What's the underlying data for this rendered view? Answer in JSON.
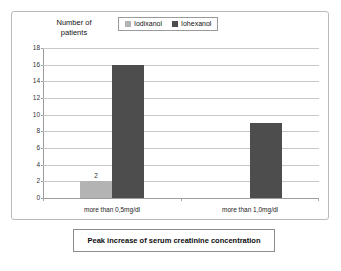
{
  "chart_data": {
    "type": "bar",
    "title": "",
    "caption": "Peak increase of serum creatinine concentration",
    "ylabel": "Number of\npatients",
    "xlabel": "",
    "ylim": [
      0,
      18
    ],
    "yticks": [
      0,
      2,
      4,
      6,
      8,
      10,
      12,
      14,
      16,
      18
    ],
    "ytick_labels": [
      "0",
      "2",
      "4",
      "6",
      "8",
      "10",
      "12",
      "14",
      "16",
      "18"
    ],
    "grid": true,
    "legend_position": "top-center",
    "categories": [
      "more than 0,5mg/dl",
      "more than 1,0mg/dl"
    ],
    "series": [
      {
        "name": "Iodixanol",
        "color": "#b3b3b3",
        "values": [
          2,
          0
        ],
        "data_labels": [
          "2",
          ""
        ]
      },
      {
        "name": "Iohexanol",
        "color": "#4d4d4d",
        "values": [
          16,
          9
        ],
        "data_labels": [
          "",
          ""
        ]
      }
    ]
  },
  "legend": {
    "items": [
      {
        "label": "Iodixanol",
        "color": "#b3b3b3"
      },
      {
        "label": "Iohexanol",
        "color": "#4d4d4d"
      }
    ]
  },
  "axis": {
    "y_title": "Number of\npatients"
  },
  "caption": {
    "text": "Peak increase of serum creatinine concentration"
  }
}
